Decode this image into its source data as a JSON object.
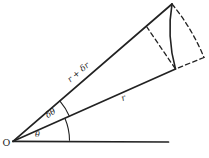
{
  "diagram": {
    "background_color": "#ffffff",
    "ink_color": "#222222",
    "labels": {
      "origin": "O",
      "theta": "θ",
      "delta_theta": "δθ",
      "r": "r",
      "r_plus_delta_r": "r + δr"
    }
  }
}
